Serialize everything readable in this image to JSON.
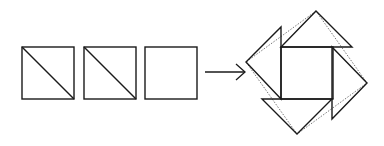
{
  "diagram": {
    "stroke_color": "#1a1a1a",
    "dotted_color": "#555555",
    "background": "#ffffff",
    "input_pieces": [
      {
        "id": "square-1",
        "type": "square-with-diagonal",
        "x": 22,
        "y": 47,
        "size": 52
      },
      {
        "id": "square-2",
        "type": "square-with-diagonal",
        "x": 84,
        "y": 47,
        "size": 52
      },
      {
        "id": "square-3",
        "type": "plain-square",
        "x": 145,
        "y": 47,
        "size": 52
      }
    ],
    "arrow": {
      "x1": 205,
      "y1": 72,
      "x2": 245,
      "y2": 72
    },
    "result": {
      "center_square": {
        "x": 281,
        "y": 47,
        "size": 52
      },
      "triangles": [
        {
          "id": "top",
          "points": "281,47 352,47 316,11"
        },
        {
          "id": "right",
          "points": "332,47 332,119 367,83"
        },
        {
          "id": "bottom",
          "points": "262,99 332,99 297,134"
        },
        {
          "id": "left",
          "points": "281,99 281,27 246,62"
        }
      ],
      "dotted_square": "316,11 367,83 297,134 246,62"
    }
  }
}
